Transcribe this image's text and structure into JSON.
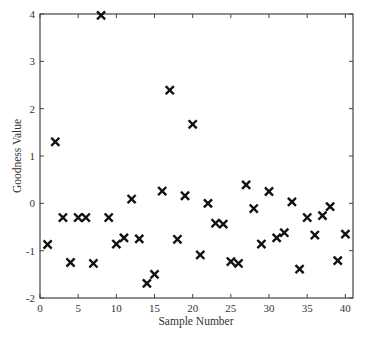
{
  "chart_data": {
    "type": "scatter",
    "title": "",
    "xlabel": "Sample Number",
    "ylabel": "Goodness Value",
    "xlim": [
      0,
      41
    ],
    "ylim": [
      -2,
      4
    ],
    "xticks": [
      0,
      5,
      10,
      15,
      20,
      25,
      30,
      35,
      40
    ],
    "yticks": [
      -2,
      -1,
      0,
      1,
      2,
      3,
      4
    ],
    "grid": false,
    "legend": null,
    "marker": "x",
    "x": [
      1,
      2,
      3,
      4,
      5,
      6,
      7,
      8,
      9,
      10,
      11,
      12,
      13,
      14,
      15,
      16,
      17,
      18,
      19,
      20,
      21,
      22,
      23,
      24,
      25,
      26,
      27,
      28,
      29,
      30,
      31,
      32,
      33,
      34,
      35,
      36,
      37,
      38,
      39,
      40
    ],
    "y": [
      -0.87,
      1.3,
      -0.3,
      -1.25,
      -0.3,
      -0.3,
      -1.27,
      3.97,
      -0.3,
      -0.86,
      -0.73,
      0.09,
      -0.75,
      -1.69,
      -1.5,
      0.26,
      2.39,
      -0.76,
      0.16,
      1.67,
      -1.09,
      0.0,
      -0.42,
      -0.44,
      -1.23,
      -1.27,
      0.39,
      -0.11,
      -0.86,
      0.25,
      -0.73,
      -0.62,
      0.03,
      -1.39,
      -0.3,
      -0.67,
      -0.26,
      -0.07,
      -1.21,
      -0.65
    ]
  }
}
